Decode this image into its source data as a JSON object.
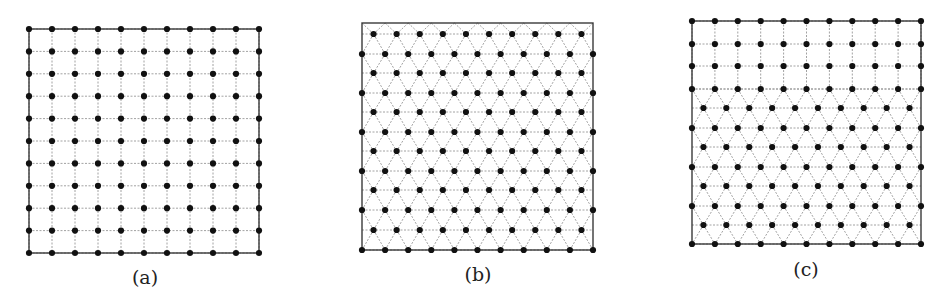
{
  "figure": {
    "panels": [
      {
        "id": "a",
        "caption": "(a)",
        "lattice": "square",
        "box": {
          "x0": 29,
          "y0": 29,
          "x1": 259,
          "y1": 253
        },
        "square_rows": 11,
        "cols": 11,
        "caption_pos": {
          "x": 145,
          "y": 266
        }
      },
      {
        "id": "b",
        "caption": "(b)",
        "lattice": "triangular",
        "box": {
          "x0": 362,
          "y0": 23,
          "x1": 593,
          "y1": 250
        },
        "rows_y": [
          34,
          54,
          73,
          93,
          112,
          132,
          151,
          171,
          190,
          210,
          230,
          250
        ],
        "cols_full": 11,
        "caption_pos": {
          "x": 478,
          "y": 263
        }
      },
      {
        "id": "c",
        "caption": "(c)",
        "lattice": "square-over-triangular",
        "box": {
          "x0": 692,
          "y0": 21,
          "x1": 921,
          "y1": 244
        },
        "square_rows_y": [
          21,
          44,
          66,
          89
        ],
        "tri_rows_y": [
          108,
          128,
          147,
          167,
          186,
          206,
          225,
          244
        ],
        "cols_full": 11,
        "caption_pos": {
          "x": 806,
          "y": 258
        }
      }
    ],
    "colors": {
      "node": "#111111",
      "bond": "#8a8a8a",
      "frame": "#3a3a3a",
      "background": "#ffffff"
    }
  }
}
